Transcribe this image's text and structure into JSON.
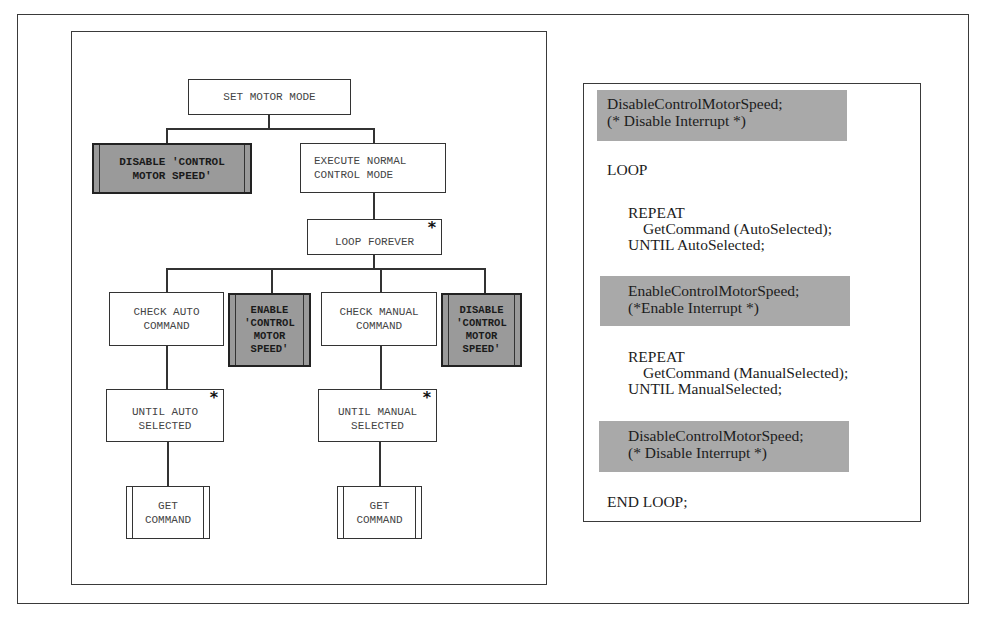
{
  "diagram": {
    "nodes": {
      "root": {
        "label": "SET MOTOR MODE"
      },
      "disable_top": {
        "label": "DISABLE 'CONTROL\nMOTOR SPEED'"
      },
      "execute": {
        "label": "EXECUTE NORMAL\nCONTROL MODE"
      },
      "loop": {
        "label": "LOOP FOREVER",
        "marker": "*"
      },
      "check_auto": {
        "label": "CHECK AUTO\nCOMMAND"
      },
      "enable": {
        "label": "ENABLE\n'CONTROL\nMOTOR\nSPEED'"
      },
      "check_manual": {
        "label": "CHECK MANUAL\nCOMMAND"
      },
      "disable_loop": {
        "label": "DISABLE\n'CONTROL\nMOTOR\nSPEED'"
      },
      "until_auto": {
        "label": "UNTIL AUTO\nSELECTED",
        "marker": "*"
      },
      "until_manual": {
        "label": "UNTIL MANUAL\nSELECTED",
        "marker": "*"
      },
      "get_cmd_auto": {
        "label": "GET\nCOMMAND"
      },
      "get_cmd_manual": {
        "label": "GET\nCOMMAND"
      }
    },
    "edges": [
      [
        "root",
        "disable_top"
      ],
      [
        "root",
        "execute"
      ],
      [
        "execute",
        "loop"
      ],
      [
        "loop",
        "check_auto"
      ],
      [
        "loop",
        "enable"
      ],
      [
        "loop",
        "check_manual"
      ],
      [
        "loop",
        "disable_loop"
      ],
      [
        "check_auto",
        "until_auto"
      ],
      [
        "until_auto",
        "get_cmd_auto"
      ],
      [
        "check_manual",
        "until_manual"
      ],
      [
        "until_manual",
        "get_cmd_manual"
      ]
    ],
    "colors": {
      "shaded_fill": "#9a9a9a",
      "highlight_fill": "#a9a9a9",
      "line": "#333333"
    }
  },
  "code": {
    "block1": {
      "line1": "DisableControlMotorSpeed;",
      "line2": "(* Disable Interrupt *)"
    },
    "loop": "LOOP",
    "repeat1": {
      "kw": "REPEAT",
      "call": "GetCommand (AutoSelected);",
      "until": "UNTIL AutoSelected;"
    },
    "block2": {
      "line1": "EnableControlMotorSpeed;",
      "line2": "(*Enable Interrupt *)"
    },
    "repeat2": {
      "kw": "REPEAT",
      "call": "GetCommand (ManualSelected);",
      "until": "UNTIL ManualSelected;"
    },
    "block3": {
      "line1": "DisableControlMotorSpeed;",
      "line2": "(* Disable Interrupt *)"
    },
    "end": "END LOOP;"
  }
}
